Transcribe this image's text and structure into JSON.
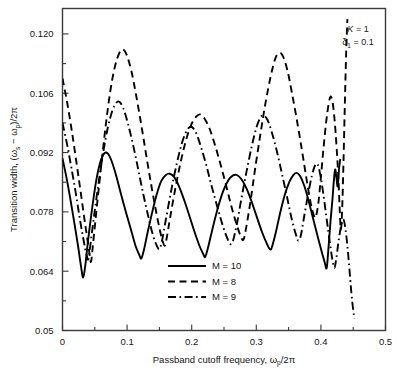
{
  "chart_data": {
    "type": "line",
    "title": "",
    "xlabel": "Passband cutoff frequency, ωp/2π",
    "ylabel": "Transition width, (ωs − ωp)/2π",
    "xlim": [
      0,
      0.5
    ],
    "ylim": [
      0.05,
      0.126
    ],
    "grid": false,
    "legend_position": "lower-center",
    "xticks": [
      0,
      0.1,
      0.2,
      0.3,
      0.4,
      0.5
    ],
    "xtick_labels": [
      "0",
      "0.1",
      "0.2",
      "0.3",
      "0.4",
      "0.5"
    ],
    "xminor_step": 0.05,
    "yticks": [
      0.05,
      0.064,
      0.078,
      0.092,
      0.106,
      0.12
    ],
    "ytick_labels": [
      "0.05",
      "0.064",
      "0.078",
      "0.092",
      "0.106",
      "0.120"
    ],
    "yminor": [
      0.057,
      0.071,
      0.085,
      0.099,
      0.113
    ],
    "annotations": [
      {
        "text": "K = 1",
        "x": 0.43,
        "y": 0.1225
      },
      {
        "text": "δ1 = 0.1",
        "x": 0.43,
        "y": 0.1185
      }
    ],
    "series": [
      {
        "name": "M = 10",
        "label": "M = 10",
        "style": "solid",
        "color": "#000000",
        "points": [
          [
            0.0,
            0.0906
          ],
          [
            0.006,
            0.0862
          ],
          [
            0.012,
            0.0812
          ],
          [
            0.018,
            0.0757
          ],
          [
            0.024,
            0.07
          ],
          [
            0.029,
            0.0648
          ],
          [
            0.032,
            0.0625
          ],
          [
            0.035,
            0.065
          ],
          [
            0.04,
            0.0718
          ],
          [
            0.046,
            0.079
          ],
          [
            0.052,
            0.0852
          ],
          [
            0.058,
            0.0895
          ],
          [
            0.064,
            0.0917
          ],
          [
            0.07,
            0.0918
          ],
          [
            0.076,
            0.09
          ],
          [
            0.083,
            0.0866
          ],
          [
            0.09,
            0.0825
          ],
          [
            0.098,
            0.078
          ],
          [
            0.106,
            0.0738
          ],
          [
            0.113,
            0.07
          ],
          [
            0.119,
            0.0678
          ],
          [
            0.122,
            0.067
          ],
          [
            0.126,
            0.069
          ],
          [
            0.132,
            0.0733
          ],
          [
            0.139,
            0.078
          ],
          [
            0.146,
            0.0822
          ],
          [
            0.153,
            0.0853
          ],
          [
            0.16,
            0.0867
          ],
          [
            0.166,
            0.087
          ],
          [
            0.173,
            0.0862
          ],
          [
            0.181,
            0.0838
          ],
          [
            0.189,
            0.0805
          ],
          [
            0.197,
            0.0768
          ],
          [
            0.205,
            0.073
          ],
          [
            0.212,
            0.07
          ],
          [
            0.218,
            0.068
          ],
          [
            0.221,
            0.0674
          ],
          [
            0.226,
            0.07
          ],
          [
            0.233,
            0.0745
          ],
          [
            0.241,
            0.0792
          ],
          [
            0.249,
            0.083
          ],
          [
            0.257,
            0.0855
          ],
          [
            0.264,
            0.0866
          ],
          [
            0.27,
            0.0867
          ],
          [
            0.277,
            0.0857
          ],
          [
            0.285,
            0.0835
          ],
          [
            0.293,
            0.0803
          ],
          [
            0.301,
            0.0767
          ],
          [
            0.309,
            0.0732
          ],
          [
            0.316,
            0.0706
          ],
          [
            0.321,
            0.0692
          ],
          [
            0.324,
            0.0696
          ],
          [
            0.33,
            0.073
          ],
          [
            0.337,
            0.0778
          ],
          [
            0.344,
            0.082
          ],
          [
            0.351,
            0.085
          ],
          [
            0.357,
            0.0866
          ],
          [
            0.362,
            0.0872
          ],
          [
            0.368,
            0.0864
          ],
          [
            0.375,
            0.0838
          ],
          [
            0.382,
            0.08
          ],
          [
            0.389,
            0.0758
          ],
          [
            0.396,
            0.0716
          ],
          [
            0.402,
            0.0682
          ],
          [
            0.406,
            0.066
          ],
          [
            0.409,
            0.0648
          ],
          [
            0.412,
            0.07
          ],
          [
            0.415,
            0.076
          ],
          [
            0.418,
            0.0812
          ],
          [
            0.42,
            0.0852
          ],
          [
            0.422,
            0.088
          ],
          [
            0.424,
            0.0862
          ],
          [
            0.426,
            0.084
          ],
          [
            0.428,
            0.088
          ],
          [
            0.43,
            0.0905
          ]
        ]
      },
      {
        "name": "M = 8",
        "label": "M = 8",
        "style": "dashed",
        "color": "#000000",
        "points": [
          [
            0.0,
            0.1095
          ],
          [
            0.007,
            0.104
          ],
          [
            0.014,
            0.0975
          ],
          [
            0.021,
            0.0903
          ],
          [
            0.028,
            0.0828
          ],
          [
            0.035,
            0.0752
          ],
          [
            0.041,
            0.069
          ],
          [
            0.044,
            0.0662
          ],
          [
            0.047,
            0.07
          ],
          [
            0.053,
            0.079
          ],
          [
            0.06,
            0.089
          ],
          [
            0.067,
            0.0985
          ],
          [
            0.074,
            0.1065
          ],
          [
            0.081,
            0.1122
          ],
          [
            0.088,
            0.1155
          ],
          [
            0.094,
            0.1163
          ],
          [
            0.1,
            0.1148
          ],
          [
            0.107,
            0.111
          ],
          [
            0.114,
            0.1055
          ],
          [
            0.122,
            0.0985
          ],
          [
            0.13,
            0.091
          ],
          [
            0.138,
            0.0838
          ],
          [
            0.146,
            0.0772
          ],
          [
            0.153,
            0.0722
          ],
          [
            0.158,
            0.07
          ],
          [
            0.161,
            0.0716
          ],
          [
            0.167,
            0.077
          ],
          [
            0.175,
            0.0838
          ],
          [
            0.183,
            0.0898
          ],
          [
            0.191,
            0.0948
          ],
          [
            0.199,
            0.0985
          ],
          [
            0.207,
            0.1005
          ],
          [
            0.213,
            0.101
          ],
          [
            0.22,
            0.1
          ],
          [
            0.228,
            0.0975
          ],
          [
            0.236,
            0.0938
          ],
          [
            0.245,
            0.089
          ],
          [
            0.254,
            0.0838
          ],
          [
            0.262,
            0.079
          ],
          [
            0.27,
            0.0748
          ],
          [
            0.276,
            0.0722
          ],
          [
            0.28,
            0.0714
          ],
          [
            0.284,
            0.074
          ],
          [
            0.291,
            0.0805
          ],
          [
            0.298,
            0.088
          ],
          [
            0.306,
            0.096
          ],
          [
            0.314,
            0.1035
          ],
          [
            0.322,
            0.1098
          ],
          [
            0.329,
            0.114
          ],
          [
            0.335,
            0.1155
          ],
          [
            0.341,
            0.1148
          ],
          [
            0.348,
            0.1115
          ],
          [
            0.355,
            0.1062
          ],
          [
            0.363,
            0.0995
          ],
          [
            0.371,
            0.0922
          ],
          [
            0.378,
            0.0855
          ],
          [
            0.384,
            0.0802
          ],
          [
            0.389,
            0.0772
          ],
          [
            0.392,
            0.0768
          ],
          [
            0.396,
            0.08
          ],
          [
            0.4,
            0.0862
          ],
          [
            0.404,
            0.093
          ],
          [
            0.408,
            0.099
          ],
          [
            0.412,
            0.1035
          ],
          [
            0.415,
            0.1052
          ],
          [
            0.418,
            0.104
          ],
          [
            0.421,
            0.1
          ],
          [
            0.424,
            0.094
          ],
          [
            0.427,
            0.0862
          ],
          [
            0.429,
            0.079
          ],
          [
            0.431,
            0.0738
          ],
          [
            0.433,
            0.079
          ],
          [
            0.435,
            0.09
          ],
          [
            0.437,
            0.103
          ],
          [
            0.439,
            0.115
          ],
          [
            0.441,
            0.1235
          ]
        ]
      },
      {
        "name": "M = 9",
        "label": "M = 9",
        "style": "dashdot",
        "color": "#000000",
        "points": [
          [
            0.0,
            0.099
          ],
          [
            0.007,
            0.094
          ],
          [
            0.014,
            0.0882
          ],
          [
            0.021,
            0.082
          ],
          [
            0.027,
            0.0762
          ],
          [
            0.033,
            0.071
          ],
          [
            0.037,
            0.068
          ],
          [
            0.04,
            0.0668
          ],
          [
            0.043,
            0.07
          ],
          [
            0.049,
            0.0772
          ],
          [
            0.056,
            0.085
          ],
          [
            0.063,
            0.092
          ],
          [
            0.07,
            0.0978
          ],
          [
            0.077,
            0.1018
          ],
          [
            0.083,
            0.1037
          ],
          [
            0.088,
            0.104
          ],
          [
            0.094,
            0.1025
          ],
          [
            0.101,
            0.099
          ],
          [
            0.109,
            0.094
          ],
          [
            0.117,
            0.0882
          ],
          [
            0.125,
            0.0822
          ],
          [
            0.133,
            0.0768
          ],
          [
            0.14,
            0.0725
          ],
          [
            0.146,
            0.07
          ],
          [
            0.15,
            0.0692
          ],
          [
            0.154,
            0.0712
          ],
          [
            0.16,
            0.0762
          ],
          [
            0.168,
            0.0828
          ],
          [
            0.176,
            0.0888
          ],
          [
            0.184,
            0.0938
          ],
          [
            0.191,
            0.0968
          ],
          [
            0.197,
            0.098
          ],
          [
            0.202,
            0.0978
          ],
          [
            0.208,
            0.0962
          ],
          [
            0.215,
            0.093
          ],
          [
            0.223,
            0.0888
          ],
          [
            0.231,
            0.084
          ],
          [
            0.24,
            0.079
          ],
          [
            0.248,
            0.0748
          ],
          [
            0.255,
            0.0718
          ],
          [
            0.26,
            0.0704
          ],
          [
            0.264,
            0.0712
          ],
          [
            0.27,
            0.0752
          ],
          [
            0.277,
            0.0812
          ],
          [
            0.285,
            0.0876
          ],
          [
            0.293,
            0.0935
          ],
          [
            0.3,
            0.0978
          ],
          [
            0.306,
            0.1002
          ],
          [
            0.311,
            0.1008
          ],
          [
            0.317,
            0.0998
          ],
          [
            0.324,
            0.0968
          ],
          [
            0.332,
            0.0922
          ],
          [
            0.34,
            0.0868
          ],
          [
            0.348,
            0.0812
          ],
          [
            0.355,
            0.0762
          ],
          [
            0.361,
            0.0728
          ],
          [
            0.365,
            0.0712
          ],
          [
            0.369,
            0.0725
          ],
          [
            0.374,
            0.0768
          ],
          [
            0.38,
            0.082
          ],
          [
            0.386,
            0.0865
          ],
          [
            0.391,
            0.089
          ],
          [
            0.395,
            0.0892
          ],
          [
            0.399,
            0.0868
          ],
          [
            0.404,
            0.082
          ],
          [
            0.409,
            0.0762
          ],
          [
            0.414,
            0.0706
          ],
          [
            0.418,
            0.0665
          ],
          [
            0.421,
            0.0648
          ],
          [
            0.424,
            0.0672
          ],
          [
            0.428,
            0.0718
          ],
          [
            0.432,
            0.0752
          ],
          [
            0.435,
            0.0762
          ],
          [
            0.438,
            0.074
          ],
          [
            0.441,
            0.07
          ],
          [
            0.444,
            0.0648
          ],
          [
            0.447,
            0.0592
          ],
          [
            0.45,
            0.0548
          ],
          [
            0.452,
            0.0528
          ]
        ]
      }
    ]
  },
  "legend": {
    "items": [
      {
        "label": "M = 10",
        "style": "solid"
      },
      {
        "label": "M = 8",
        "style": "dashed"
      },
      {
        "label": "M = 9",
        "style": "dashdot"
      }
    ]
  },
  "annotation_box": {
    "line1_symbol": "K",
    "line1_eq": " = 1",
    "line2_symbol": "δ",
    "line2_sub": "1",
    "line2_eq": " = 0.1"
  },
  "axis": {
    "x_title_main": "Passband cutoff frequency, ",
    "x_title_sym": "ω",
    "x_title_sub": "p",
    "x_title_tail": "/2π",
    "y_title_main": "Transition width, (",
    "y_title_sym1": "ω",
    "y_title_sub1": "s",
    "y_title_mid": " − ",
    "y_title_sym2": "ω",
    "y_title_sub2": "p",
    "y_title_tail": ")/2π"
  },
  "colors": {
    "line": "#000000",
    "frame": "#3a3a3a",
    "background": "#ffffff",
    "text": "#151515"
  }
}
